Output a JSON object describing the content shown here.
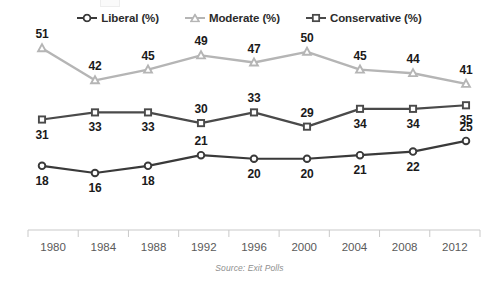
{
  "legend": {
    "position": "top-center",
    "items": [
      {
        "label": "Liberal (%)",
        "marker": "circle-marker-icon",
        "color": "#3a3a3a"
      },
      {
        "label": "Moderate (%)",
        "marker": "triangle-marker-icon",
        "color": "#b5b5b5"
      },
      {
        "label": "Conservative (%)",
        "marker": "square-marker-icon",
        "color": "#4a4a4a"
      }
    ]
  },
  "source_note": "Source: Exit Polls",
  "axis": {
    "tick_labels": [
      "1980",
      "1984",
      "1988",
      "1992",
      "1996",
      "2000",
      "2004",
      "2008",
      "2012"
    ]
  },
  "chart_data": {
    "type": "line",
    "title": "",
    "subtitle": "",
    "xlabel": "",
    "ylabel": "",
    "x": [
      1980,
      1984,
      1988,
      1992,
      1996,
      2000,
      2004,
      2008,
      2012
    ],
    "categories": [
      "1980",
      "1984",
      "1988",
      "1992",
      "1996",
      "2000",
      "2004",
      "2008",
      "2012"
    ],
    "xlim": [
      1980,
      2012
    ],
    "ylim": [
      0,
      55
    ],
    "grid": false,
    "legend_position": "top-center",
    "annotation": "Source: Exit Polls",
    "series": [
      {
        "name": "Liberal (%)",
        "color": "#3a3a3a",
        "marker": "circle",
        "values": [
          18,
          16,
          18,
          21,
          20,
          20,
          21,
          22,
          25
        ],
        "label_positions": [
          "below",
          "below",
          "below",
          "above",
          "below",
          "below",
          "below",
          "below",
          "above"
        ]
      },
      {
        "name": "Moderate (%)",
        "color": "#b5b5b5",
        "marker": "triangle",
        "values": [
          51,
          42,
          45,
          49,
          47,
          50,
          45,
          44,
          41
        ],
        "label_positions": [
          "above",
          "above",
          "above",
          "above",
          "above",
          "above",
          "above",
          "above",
          "above"
        ]
      },
      {
        "name": "Conservative (%)",
        "color": "#4a4a4a",
        "marker": "square",
        "values": [
          31,
          33,
          33,
          30,
          33,
          29,
          34,
          34,
          35
        ],
        "label_positions": [
          "below",
          "below",
          "below",
          "above",
          "above",
          "above",
          "below",
          "below",
          "below"
        ]
      }
    ]
  }
}
